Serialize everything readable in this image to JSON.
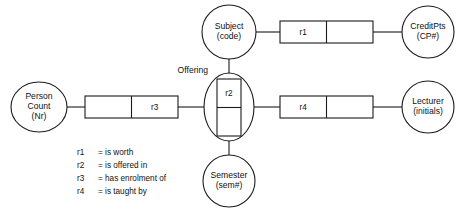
{
  "diagram": {
    "type": "object-role-model",
    "colors": {
      "background": "#ffffff",
      "stroke": "#1a1a1a",
      "text": "#111111",
      "fill": "#ffffff"
    },
    "entities": [
      {
        "id": "person-count",
        "name": "Person\nCount",
        "line1": "Person",
        "line2": "Count",
        "reference": "(Nr)",
        "shape": "ellipse",
        "cx": 39,
        "cy": 107,
        "rx": 28,
        "ry": 25
      },
      {
        "id": "subject",
        "name": "Subject",
        "line1": "Subject",
        "line2": "",
        "reference": "(code)",
        "shape": "circle",
        "cx": 229,
        "cy": 32,
        "rx": 27,
        "ry": 27
      },
      {
        "id": "semester",
        "name": "Semester",
        "line1": "Semester",
        "line2": "",
        "reference": "(sem#)",
        "shape": "circle",
        "cx": 229,
        "cy": 181,
        "rx": 26,
        "ry": 26
      },
      {
        "id": "creditpts",
        "name": "CreditPts",
        "line1": "CreditPts",
        "line2": "",
        "reference": "(CP#)",
        "shape": "circle",
        "cx": 428,
        "cy": 32,
        "rx": 26,
        "ry": 26
      },
      {
        "id": "lecturer",
        "name": "Lecturer",
        "line1": "Lecturer",
        "line2": "",
        "reference": "(initials)",
        "shape": "circle",
        "cx": 428,
        "cy": 107,
        "rx": 26,
        "ry": 26
      }
    ],
    "objectified_relationship": {
      "id": "offering",
      "label": "Offering",
      "label_x": 208,
      "label_y": 71,
      "cx": 229,
      "cy": 107,
      "rx": 25,
      "ry": 34,
      "inner_box": {
        "x": 217,
        "y": 79,
        "width": 24,
        "height": 57,
        "orientation": "vertical",
        "cells": [
          {
            "label": "r2"
          },
          {
            "label": ""
          }
        ]
      }
    },
    "fact_boxes": [
      {
        "id": "fact-r3",
        "x": 85,
        "y": 96,
        "width": 93,
        "height": 22,
        "orientation": "horizontal",
        "cells": [
          {
            "label": ""
          },
          {
            "label": "r3"
          }
        ]
      },
      {
        "id": "fact-r1",
        "x": 280,
        "y": 21,
        "width": 93,
        "height": 22,
        "orientation": "horizontal",
        "cells": [
          {
            "label": "r1"
          },
          {
            "label": ""
          }
        ]
      },
      {
        "id": "fact-r4",
        "x": 280,
        "y": 96,
        "width": 93,
        "height": 22,
        "orientation": "horizontal",
        "cells": [
          {
            "label": "r4"
          },
          {
            "label": ""
          }
        ]
      }
    ],
    "connectors": [
      {
        "id": "conn-personcount-r3",
        "x1": 67,
        "y1": 107,
        "x2": 85,
        "y2": 107
      },
      {
        "id": "conn-r3-offering",
        "x1": 178,
        "y1": 107,
        "x2": 204,
        "y2": 107
      },
      {
        "id": "conn-subject-r1",
        "x1": 256,
        "y1": 32,
        "x2": 280,
        "y2": 32
      },
      {
        "id": "conn-r1-creditpts",
        "x1": 373,
        "y1": 32,
        "x2": 402,
        "y2": 32
      },
      {
        "id": "conn-offering-r4",
        "x1": 254,
        "y1": 107,
        "x2": 280,
        "y2": 107
      },
      {
        "id": "conn-r4-lecturer",
        "x1": 373,
        "y1": 107,
        "x2": 402,
        "y2": 107
      },
      {
        "id": "conn-subject-offering",
        "x1": 229,
        "y1": 59,
        "x2": 229,
        "y2": 79
      },
      {
        "id": "conn-offering-semester",
        "x1": 229,
        "y1": 136,
        "x2": 229,
        "y2": 155
      }
    ],
    "legend": {
      "x_key": 77,
      "x_val": 98,
      "y_start": 153,
      "line_height": 13,
      "entries": [
        {
          "key": "r1",
          "eq": "=",
          "value": "is worth"
        },
        {
          "key": "r2",
          "eq": "=",
          "value": "is offered in"
        },
        {
          "key": "r3",
          "eq": "=",
          "value": "has enrolment of"
        },
        {
          "key": "r4",
          "eq": "=",
          "value": "is taught by"
        }
      ]
    }
  }
}
